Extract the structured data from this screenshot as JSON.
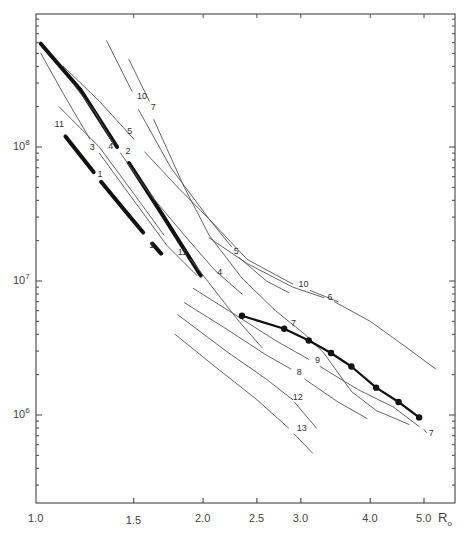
{
  "chart_data": {
    "type": "line",
    "title": "",
    "xlabel": "R_o",
    "ylabel": "",
    "x_scale": "log",
    "y_scale": "log",
    "xlim": [
      1.0,
      5.3
    ],
    "ylim": [
      250000,
      1000000000
    ],
    "grid": false,
    "x_ticks": [
      {
        "value": 1.0,
        "label": "1.0"
      },
      {
        "value": 1.5,
        "label": "1.5"
      },
      {
        "value": 2.0,
        "label": "2.0"
      },
      {
        "value": 2.5,
        "label": "2.5"
      },
      {
        "value": 3.0,
        "label": "3.0"
      },
      {
        "value": 4.0,
        "label": "4.0"
      },
      {
        "value": 5.0,
        "label": "5.0"
      }
    ],
    "y_ticks": [
      {
        "value": 1000000,
        "label": "10",
        "exp": "6"
      },
      {
        "value": 10000000,
        "label": "10",
        "exp": "7"
      },
      {
        "value": 100000000,
        "label": "10",
        "exp": "8"
      }
    ],
    "x_axis_title": {
      "main": "R",
      "sub": "o"
    },
    "series": [
      {
        "name": "2",
        "style": "thick",
        "points": [
          [
            1.02,
            590000000.0
          ],
          [
            1.2,
            270000000.0
          ],
          [
            1.4,
            100000000.0
          ]
        ]
      },
      {
        "name": "2",
        "style": "thick",
        "points": [
          [
            1.47,
            76000000.0
          ],
          [
            1.7,
            30000000.0
          ],
          [
            1.98,
            11000000.0
          ]
        ]
      },
      {
        "name": "1",
        "style": "thick",
        "points": [
          [
            1.13,
            120000000.0
          ],
          [
            1.27,
            65000000.0
          ]
        ]
      },
      {
        "name": "1",
        "style": "thick",
        "points": [
          [
            1.31,
            55000000.0
          ],
          [
            1.45,
            33000000.0
          ],
          [
            1.56,
            23000000.0
          ]
        ]
      },
      {
        "name": "1",
        "style": "thick",
        "points": [
          [
            1.62,
            19000000.0
          ],
          [
            1.68,
            16000000.0
          ]
        ]
      },
      {
        "name": "3",
        "style": "thin",
        "points": [
          [
            1.02,
            500000000.0
          ],
          [
            1.12,
            250000000.0
          ],
          [
            1.25,
            115000000.0
          ]
        ]
      },
      {
        "name": "3",
        "style": "thin",
        "points": [
          [
            1.3,
            90000000.0
          ],
          [
            1.5,
            40000000.0
          ],
          [
            1.72,
            18500000.0
          ],
          [
            1.95,
            11000000.0
          ]
        ]
      },
      {
        "name": "4",
        "style": "thin",
        "points": [
          [
            1.17,
            290000000.0
          ],
          [
            1.28,
            180000000.0
          ],
          [
            1.38,
            105000000.0
          ]
        ]
      },
      {
        "name": "4",
        "style": "thin",
        "points": [
          [
            1.42,
            90000000.0
          ],
          [
            1.6,
            45000000.0
          ],
          [
            1.85,
            22000000.0
          ],
          [
            2.1,
            12000000.0
          ],
          [
            2.35,
            8000000.0
          ]
        ]
      },
      {
        "name": "5",
        "style": "thin",
        "points": [
          [
            1.12,
            400000000.0
          ],
          [
            1.3,
            220000000.0
          ],
          [
            1.5,
            115000000.0
          ]
        ]
      },
      {
        "name": "5",
        "style": "thin",
        "points": [
          [
            1.57,
            92000000.0
          ],
          [
            1.8,
            50000000.0
          ],
          [
            2.05,
            29000000.0
          ],
          [
            2.25,
            18000000.0
          ]
        ]
      },
      {
        "name": "5",
        "style": "thin",
        "points": [
          [
            2.32,
            15000000.0
          ],
          [
            2.6,
            10000000.0
          ],
          [
            2.85,
            8200000.0
          ]
        ]
      },
      {
        "name": "7",
        "style": "thin",
        "points": [
          [
            1.47,
            450000000.0
          ],
          [
            1.6,
            220000000.0
          ]
        ]
      },
      {
        "name": "7",
        "style": "thin",
        "points": [
          [
            1.63,
            160000000.0
          ],
          [
            1.85,
            50000000.0
          ],
          [
            2.05,
            22000000.0
          ],
          [
            2.35,
            10500000.0
          ],
          [
            2.7,
            6000000.0
          ],
          [
            3.05,
            4000000.0
          ],
          [
            3.3,
            2900000.0
          ],
          [
            3.7,
            1500000.0
          ],
          [
            4.1,
            1080000.0
          ],
          [
            4.7,
            850000.0
          ]
        ]
      },
      {
        "name": "7",
        "style": "thin",
        "points": [
          [
            5.0,
            780000.0
          ],
          [
            5.05,
            740000.0
          ]
        ]
      },
      {
        "name": "10",
        "style": "thin",
        "points": [
          [
            1.34,
            620000000.0
          ],
          [
            1.49,
            260000000.0
          ]
        ]
      },
      {
        "name": "10",
        "style": "thin",
        "points": [
          [
            1.53,
            190000000.0
          ],
          [
            1.75,
            70000000.0
          ],
          [
            2.05,
            29000000.0
          ],
          [
            2.4,
            14500000.0
          ],
          [
            2.9,
            9500000.0
          ]
        ]
      },
      {
        "name": "10",
        "style": "thin",
        "points": [
          [
            3.12,
            8500000.0
          ],
          [
            3.5,
            7000000.0
          ]
        ]
      },
      {
        "name": "6",
        "style": "thin",
        "points": [
          [
            2.05,
            21000000.0
          ],
          [
            2.4,
            13500000.0
          ],
          [
            2.9,
            9000000.0
          ],
          [
            3.3,
            7500000.0
          ]
        ]
      },
      {
        "name": "6",
        "style": "thin",
        "points": [
          [
            3.45,
            7000000.0
          ],
          [
            4.0,
            5000000.0
          ],
          [
            4.6,
            3300000.0
          ],
          [
            5.25,
            2200000.0
          ]
        ]
      },
      {
        "name": "11",
        "style": "thin",
        "points": [
          [
            1.1,
            200000000.0
          ],
          [
            1.3,
            100000000.0
          ],
          [
            1.5,
            45000000.0
          ],
          [
            1.7,
            22000000.0
          ]
        ]
      },
      {
        "name": "11",
        "style": "thin",
        "points": [
          [
            1.9,
            14500000.0
          ],
          [
            2.1,
            8500000.0
          ],
          [
            2.32,
            5000000.0
          ],
          [
            2.55,
            3200000.0
          ]
        ]
      },
      {
        "name": "8",
        "style": "thin",
        "points": [
          [
            1.85,
            6900000.0
          ],
          [
            2.2,
            4400000.0
          ],
          [
            2.6,
            2800000.0
          ],
          [
            2.88,
            2200000.0
          ]
        ]
      },
      {
        "name": "8",
        "style": "thin",
        "points": [
          [
            3.05,
            1850000.0
          ],
          [
            3.5,
            1250000.0
          ],
          [
            3.95,
            940000.0
          ]
        ]
      },
      {
        "name": "9",
        "style": "thin",
        "points": [
          [
            1.92,
            8800000.0
          ],
          [
            2.3,
            5500000.0
          ],
          [
            2.7,
            3600000.0
          ],
          [
            3.1,
            2600000.0
          ]
        ]
      },
      {
        "name": "9",
        "style": "thin",
        "points": [
          [
            3.25,
            2300000.0
          ],
          [
            3.8,
            1550000.0
          ],
          [
            4.4,
            1150000.0
          ],
          [
            4.9,
            820000.0
          ]
        ]
      },
      {
        "name": "12",
        "style": "thin",
        "points": [
          [
            1.8,
            5600000.0
          ],
          [
            2.2,
            3000000.0
          ],
          [
            2.6,
            1850000.0
          ],
          [
            2.9,
            1300000.0
          ]
        ]
      },
      {
        "name": "12",
        "style": "thin",
        "points": [
          [
            2.92,
            1250000.0
          ],
          [
            3.2,
            800000.0
          ]
        ]
      },
      {
        "name": "13",
        "style": "thin",
        "points": [
          [
            1.78,
            4000000.0
          ],
          [
            2.1,
            2300000.0
          ],
          [
            2.5,
            1300000.0
          ],
          [
            2.85,
            800000.0
          ]
        ]
      },
      {
        "name": "13",
        "style": "thin",
        "points": [
          [
            2.92,
            720000.0
          ],
          [
            3.15,
            520000.0
          ]
        ]
      },
      {
        "name": "observed",
        "style": "markers",
        "points": [
          [
            2.35,
            5500000.0
          ],
          [
            2.8,
            4400000.0
          ],
          [
            3.1,
            3600000.0
          ],
          [
            3.4,
            2900000.0
          ],
          [
            3.7,
            2300000.0
          ],
          [
            4.1,
            1600000.0
          ],
          [
            4.5,
            1250000.0
          ],
          [
            4.9,
            960000.0
          ]
        ]
      }
    ],
    "labels": [
      {
        "text": "11",
        "x": 1.08,
        "y": 140000000.0
      },
      {
        "text": "3",
        "x": 1.25,
        "y": 95000000.0
      },
      {
        "text": "4",
        "x": 1.35,
        "y": 97000000.0
      },
      {
        "text": "2",
        "x": 1.45,
        "y": 88000000.0
      },
      {
        "text": "5",
        "x": 1.46,
        "y": 125000000.0
      },
      {
        "text": "1",
        "x": 1.29,
        "y": 60000000.0
      },
      {
        "text": "1",
        "x": 1.6,
        "y": 17500000.0
      },
      {
        "text": "10",
        "x": 1.52,
        "y": 230000000.0
      },
      {
        "text": "7",
        "x": 1.61,
        "y": 190000000.0
      },
      {
        "text": "5",
        "x": 2.27,
        "y": 16000000.0
      },
      {
        "text": "11",
        "x": 1.8,
        "y": 15500000.0
      },
      {
        "text": "4",
        "x": 2.12,
        "y": 11000000.0
      },
      {
        "text": "10",
        "x": 2.97,
        "y": 9000000.0
      },
      {
        "text": "6",
        "x": 3.35,
        "y": 7200000.0
      },
      {
        "text": "7",
        "x": 2.88,
        "y": 4600000.0
      },
      {
        "text": "8",
        "x": 2.95,
        "y": 2000000.0
      },
      {
        "text": "9",
        "x": 3.18,
        "y": 2450000.0
      },
      {
        "text": "12",
        "x": 2.9,
        "y": 1300000.0
      },
      {
        "text": "13",
        "x": 2.95,
        "y": 760000.0
      },
      {
        "text": "7",
        "x": 5.1,
        "y": 700000.0
      }
    ]
  }
}
